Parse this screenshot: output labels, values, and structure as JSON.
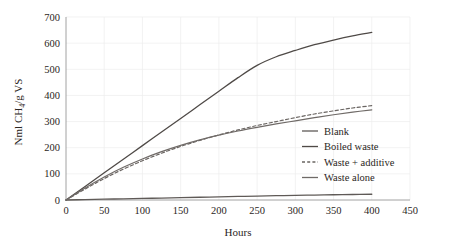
{
  "chart_data": {
    "type": "line",
    "title": "",
    "xlabel": "Hours",
    "ylabel": "Nml CH4/g VS",
    "ylabel_parts": {
      "pre": "Nml CH",
      "sub": "4",
      "post": "/g VS"
    },
    "xlim": [
      0,
      450
    ],
    "ylim": [
      0,
      700
    ],
    "xticks": [
      0,
      50,
      100,
      150,
      200,
      250,
      300,
      350,
      400,
      450
    ],
    "yticks": [
      0,
      100,
      200,
      300,
      400,
      500,
      600,
      700
    ],
    "grid": true,
    "legend_position": "center-right",
    "series": [
      {
        "name": "Blank",
        "style": "solid",
        "color": "#5f5a57",
        "width": 1.3,
        "x": [
          0,
          25,
          50,
          75,
          100,
          125,
          150,
          175,
          200,
          225,
          250,
          275,
          300,
          325,
          350,
          375,
          400
        ],
        "values": [
          0,
          1.5,
          3,
          4.5,
          6,
          7.5,
          9,
          10.5,
          12,
          13.5,
          15,
          16.5,
          18,
          19,
          20,
          21,
          22
        ]
      },
      {
        "name": "Boiled waste",
        "style": "solid",
        "color": "#4f4a47",
        "width": 1.3,
        "x": [
          0,
          25,
          50,
          75,
          100,
          125,
          150,
          175,
          200,
          225,
          250,
          275,
          300,
          325,
          350,
          375,
          400
        ],
        "values": [
          0,
          52,
          104,
          156,
          208,
          260,
          312,
          364,
          416,
          468,
          515,
          548,
          572,
          594,
          612,
          628,
          641
        ]
      },
      {
        "name": "Waste + additive",
        "style": "dashed",
        "color": "#6a6562",
        "width": 1.2,
        "x": [
          0,
          25,
          50,
          75,
          100,
          125,
          150,
          175,
          200,
          225,
          250,
          275,
          300,
          325,
          350,
          375,
          400
        ],
        "values": [
          0,
          42,
          82,
          118,
          150,
          179,
          205,
          228,
          249,
          268,
          285,
          300,
          315,
          329,
          341,
          352,
          361
        ]
      },
      {
        "name": "Waste alone",
        "style": "solid",
        "color": "#6f6a67",
        "width": 1.2,
        "x": [
          0,
          25,
          50,
          75,
          100,
          125,
          150,
          175,
          200,
          225,
          250,
          275,
          300,
          325,
          350,
          375,
          400
        ],
        "values": [
          0,
          46,
          88,
          125,
          157,
          185,
          209,
          230,
          248,
          264,
          278,
          291,
          303,
          315,
          326,
          336,
          345
        ]
      }
    ]
  },
  "axes": {
    "x_tick_labels": [
      "0",
      "50",
      "100",
      "150",
      "200",
      "250",
      "300",
      "350",
      "400",
      "450"
    ],
    "y_tick_labels": [
      "0",
      "100",
      "200",
      "300",
      "400",
      "500",
      "600",
      "700"
    ],
    "x_axis_title": "Hours"
  },
  "legend": {
    "entries": [
      {
        "label": "Blank",
        "style": "solid"
      },
      {
        "label": "Boiled waste",
        "style": "solid"
      },
      {
        "label": "Waste + additive",
        "style": "dashed"
      },
      {
        "label": "Waste alone",
        "style": "solid"
      }
    ]
  }
}
